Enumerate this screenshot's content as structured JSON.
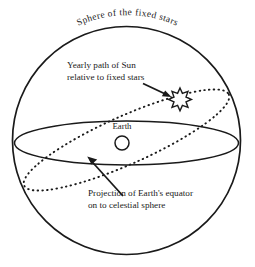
{
  "figure": {
    "title": "Sphere of the fixed stars",
    "background_color": "#ffffff",
    "ink_color": "#1a1a1a"
  },
  "labels": {
    "sphere_title": "Sphere of the fixed stars",
    "sun_path_line1": "Yearly path of Sun",
    "sun_path_line2": "relative to fixed stars",
    "earth": "Earth",
    "equator_projection_line1": "Projection of Earth's equator",
    "equator_projection_line2": "on to celestial sphere"
  },
  "elements": {
    "sphere": {
      "name": "celestial-sphere",
      "cx": 126.5,
      "cy": 140.5,
      "r": 114
    },
    "equator": {
      "name": "celestial-equator",
      "cx": 126.5,
      "cy": 143,
      "rx": 112,
      "ry": 22,
      "style": "solid"
    },
    "ecliptic": {
      "name": "ecliptic-path",
      "cx": 126.5,
      "cy": 140,
      "rx": 112,
      "ry": 24,
      "rotation_deg": -24,
      "style": "dotted"
    },
    "earth_marker": {
      "name": "earth-marker",
      "cx": 122,
      "cy": 143,
      "r": 7
    },
    "sun_marker": {
      "name": "sun-marker",
      "cx": 180,
      "cy": 97,
      "points": 8,
      "outer_r": 9,
      "inner_r": 5.4
    }
  }
}
